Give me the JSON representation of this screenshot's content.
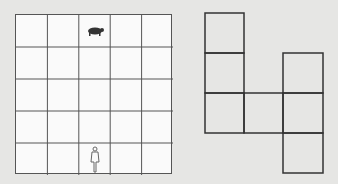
{
  "grid": {
    "rows": 5,
    "cols": 5
  },
  "pig": {
    "label": "pig",
    "row": 0,
    "col": 2
  },
  "person": {
    "label": "person",
    "row": 4,
    "col": 2
  },
  "net": {
    "cell_size": 39.5,
    "origin": [
      205,
      13
    ],
    "cells": [
      [
        0,
        0
      ],
      [
        0,
        1
      ],
      [
        0,
        2
      ],
      [
        1,
        2
      ],
      [
        2,
        1
      ],
      [
        2,
        2
      ],
      [
        2,
        3
      ]
    ]
  }
}
